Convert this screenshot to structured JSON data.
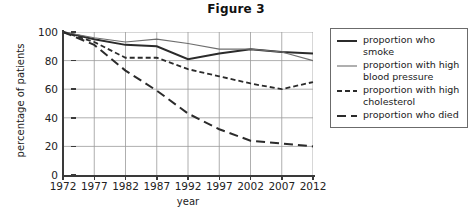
{
  "chart_data": {
    "type": "line",
    "title": "Figure 3",
    "xlabel": "year",
    "ylabel": "percentage of patients",
    "categories": [
      1972,
      1977,
      1982,
      1987,
      1992,
      1997,
      2002,
      2007,
      2012
    ],
    "xticklabels": [
      "1972",
      "1977",
      "1982",
      "1987",
      "1992",
      "1997",
      "2002",
      "2007",
      "2012"
    ],
    "yticklabels": [
      "0",
      "20",
      "40",
      "60",
      "80",
      "100"
    ],
    "yticks": [
      0,
      20,
      40,
      60,
      80,
      100
    ],
    "ylim": [
      0,
      100
    ],
    "xlim": [
      1972,
      2012
    ],
    "grid": true,
    "legend_position": "right",
    "series": [
      {
        "name": "proportion who smoke",
        "style": "solid",
        "width": 2.0,
        "color": "#2b2b2b",
        "values": [
          100,
          95,
          91,
          90,
          81,
          85,
          88,
          86,
          85
        ]
      },
      {
        "name": "proportion with high blood pressure",
        "style": "solid",
        "width": 1.1,
        "color": "#6e6e6e",
        "values": [
          100,
          96,
          93,
          95,
          92,
          88,
          88,
          86,
          80
        ]
      },
      {
        "name": "proportion with high cholesterol",
        "style": "dashed-short",
        "width": 1.8,
        "color": "#2b2b2b",
        "values": [
          100,
          93,
          82,
          82,
          74,
          69,
          64,
          60,
          65
        ]
      },
      {
        "name": "proportion who died",
        "style": "dashed-long",
        "width": 2.0,
        "color": "#2b2b2b",
        "values": [
          100,
          91,
          73,
          59,
          43,
          32,
          24,
          22,
          20
        ]
      }
    ]
  },
  "legend": {
    "entries": [
      {
        "label": "proportion who smoke"
      },
      {
        "label": "proportion with high blood pressure"
      },
      {
        "label": "proportion with high cholesterol"
      },
      {
        "label": "proportion who died"
      }
    ]
  }
}
